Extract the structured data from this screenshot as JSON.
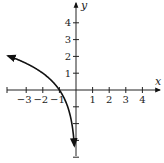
{
  "chart_data": {
    "type": "line",
    "title": "",
    "xlabel": "x",
    "ylabel": "y",
    "xlim": [
      -3.2,
      4.9
    ],
    "ylim": [
      -4,
      4.5
    ],
    "grid": false,
    "legend": null,
    "x_ticks": [
      -3,
      -2,
      -1,
      1,
      2,
      3,
      4
    ],
    "x_tick_labels": [
      "−3",
      "−2",
      "−1",
      "1",
      "2",
      "3",
      "4"
    ],
    "y_ticks": [
      1,
      2,
      3,
      4,
      -1,
      -2,
      -3,
      -4
    ],
    "y_tick_labels": [
      "1",
      "2",
      "3",
      "4"
    ],
    "series": [
      {
        "name": "y = log2(-x)",
        "x": [
          -4,
          -3.5,
          -3,
          -2.5,
          -2,
          -1.5,
          -1,
          -0.75,
          -0.5,
          -0.35,
          -0.25,
          -0.18,
          -0.125,
          -0.09
        ],
        "y": [
          2,
          1.81,
          1.58,
          1.32,
          1,
          0.58,
          0,
          -0.42,
          -1,
          -1.51,
          -2,
          -2.47,
          -3,
          -3.47
        ],
        "arrows": "both",
        "color": "#111111"
      }
    ]
  },
  "axes": {
    "x_label": "x",
    "y_label": "y"
  }
}
